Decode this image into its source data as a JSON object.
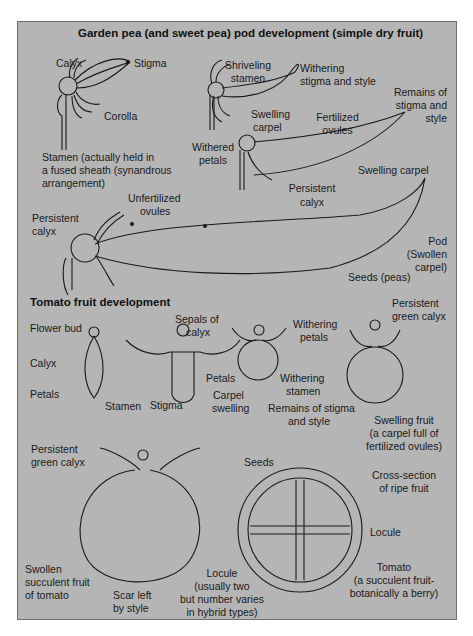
{
  "panel": {
    "background": "#b5b5b5",
    "border": "#6e6e6e"
  },
  "pea": {
    "title": "Garden pea (and sweet pea) pod development (simple dry fruit)",
    "stage1": {
      "calyx": "Calyx",
      "stigma": "Stigma",
      "corolla": "Corolla",
      "stamen_1": "Stamen (actually held in",
      "stamen_2": "a fused sheath (synandrous",
      "stamen_3": "arrangement)"
    },
    "stage2": {
      "shriveling_1": "Shriveling",
      "shriveling_2": "stamen",
      "withering_1": "Withering",
      "withering_2": "stigma and style",
      "swelling_1": "Swelling",
      "swelling_2": "carpel",
      "withered_1": "Withered",
      "withered_2": "petals"
    },
    "stage3": {
      "fertilized_1": "Fertilized",
      "fertilized_2": "ovules",
      "remains_1": "Remains of",
      "remains_2": "stigma and",
      "remains_3": "style",
      "swelling_carpel": "Swelling carpel",
      "persistent_1": "Persistent",
      "persistent_2": "calyx"
    },
    "stage4": {
      "unfertilized_1": "Unfertilized",
      "unfertilized_2": "ovules",
      "persistent_1": "Persistent",
      "persistent_2": "calyx",
      "pod_1": "Pod",
      "pod_2": "(Swollen",
      "pod_3": "carpel)",
      "seeds": "Seeds (peas)"
    }
  },
  "tomato": {
    "title": "Tomato fruit development",
    "bud": {
      "flower_bud": "Flower bud",
      "calyx": "Calyx",
      "petals": "Petals"
    },
    "flower": {
      "sepals_1": "Sepals of",
      "sepals_2": "calyx",
      "petals": "Petals",
      "stamen": "Stamen",
      "stigma": "Stigma"
    },
    "early": {
      "withering_petals_1": "Withering",
      "withering_petals_2": "petals",
      "withering_stamen_1": "Withering",
      "withering_stamen_2": "stamen",
      "carpel_1": "Carpel",
      "carpel_2": "swelling",
      "remains_1": "Remains of stigma",
      "remains_2": "and style"
    },
    "swelling": {
      "persistent_1": "Persistent",
      "persistent_2": "green calyx",
      "fruit_1": "Swelling fruit",
      "fruit_2": "(a carpel full of",
      "fruit_3": "fertilized ovules)"
    },
    "ripe": {
      "persistent_1": "Persistent",
      "persistent_2": "green calyx",
      "swollen_1": "Swollen",
      "swollen_2": "succulent fruit",
      "swollen_3": "of tomato",
      "scar_1": "Scar left",
      "scar_2": "by style"
    },
    "section": {
      "seeds": "Seeds",
      "cross_1": "Cross-section",
      "cross_2": "of ripe fruit",
      "locule": "Locule",
      "locule_note_1": "Locule",
      "locule_note_2": "(usually two",
      "locule_note_3": "but number varies",
      "locule_note_4": "in hybrid types)",
      "tomato_1": "Tomato",
      "tomato_2": "(a succulent fruit-",
      "tomato_3": "botanically a berry)"
    }
  }
}
